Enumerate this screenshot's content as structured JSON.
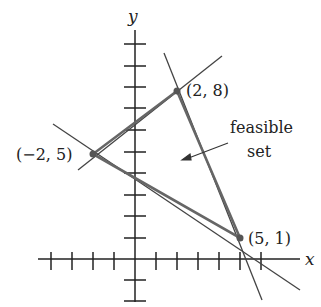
{
  "diagram": {
    "type": "linear-programming-feasible-region",
    "axes": {
      "x_label": "x",
      "y_label": "y",
      "x_ticks": [
        -4,
        -3,
        -2,
        -1,
        1,
        2,
        3,
        4,
        5,
        6
      ],
      "y_ticks": [
        -2,
        -1,
        1,
        2,
        3,
        4,
        5,
        6,
        7,
        8,
        9,
        10,
        11
      ]
    },
    "vertices": [
      {
        "label": "(2, 8)",
        "x": 2,
        "y": 8
      },
      {
        "label": "(−2, 5)",
        "x": -2,
        "y": 5
      },
      {
        "label": "(5, 1)",
        "x": 5,
        "y": 1
      }
    ],
    "annotation": {
      "line1": "feasible",
      "line2": "set"
    },
    "colors": {
      "boundary": "#555555",
      "axis": "#222222",
      "vertex": "#555555"
    }
  }
}
